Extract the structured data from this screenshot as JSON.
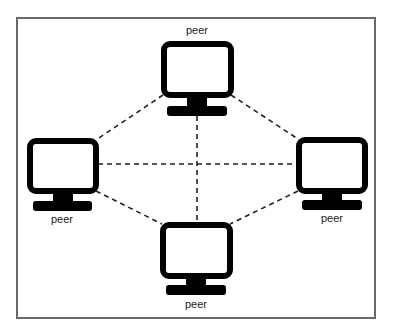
{
  "diagram": {
    "type": "peer-to-peer network",
    "frame_color": "#6b6b6b",
    "link_color": "#222222",
    "monitor_color": "#000000",
    "nodes": [
      {
        "id": "top",
        "label": "peer",
        "icon": "monitor-icon"
      },
      {
        "id": "left",
        "label": "peer",
        "icon": "monitor-icon"
      },
      {
        "id": "right",
        "label": "peer",
        "icon": "monitor-icon"
      },
      {
        "id": "bottom",
        "label": "peer",
        "icon": "monitor-icon"
      }
    ],
    "links": [
      {
        "from": "top",
        "to": "left",
        "style": "dashed"
      },
      {
        "from": "top",
        "to": "right",
        "style": "dashed"
      },
      {
        "from": "top",
        "to": "bottom",
        "style": "dashed"
      },
      {
        "from": "left",
        "to": "right",
        "style": "dashed"
      },
      {
        "from": "left",
        "to": "bottom",
        "style": "dashed"
      },
      {
        "from": "right",
        "to": "bottom",
        "style": "dashed"
      }
    ]
  }
}
